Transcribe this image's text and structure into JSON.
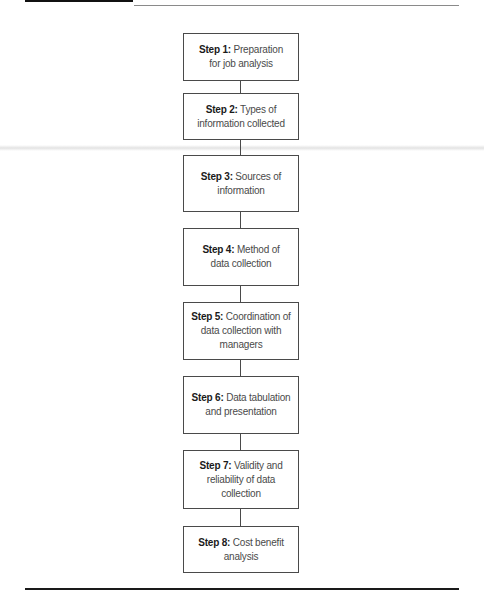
{
  "figure": {
    "steps": [
      {
        "label": "Step 1:",
        "text": " Preparation for job analysis",
        "lines": [
          "Preparation for",
          "job analysis"
        ]
      },
      {
        "label": "Step 2:",
        "text": " Types of information collected"
      },
      {
        "label": "Step 3:",
        "text": " Sources of information"
      },
      {
        "label": "Step 4:",
        "text": " Method of data collection"
      },
      {
        "label": "Step 5:",
        "text": " Coordination of data collection with managers"
      },
      {
        "label": "Step 6:",
        "text": " Data tabulation and presentation"
      },
      {
        "label": "Step 7:",
        "text": " Validity and reliability of data collection"
      },
      {
        "label": "Step 8:",
        "text": " Cost benefit analysis"
      }
    ]
  }
}
